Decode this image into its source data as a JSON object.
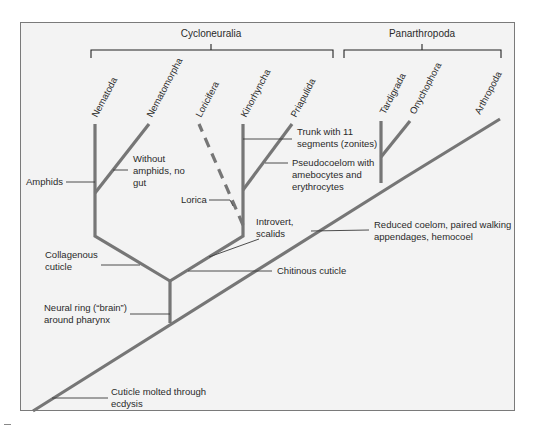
{
  "diagram": {
    "type": "phylogenetic-tree",
    "clades": {
      "cycloneuralia": "Cycloneuralia",
      "panarthropoda": "Panarthropoda"
    },
    "taxa": {
      "nematoda": "Nematoda",
      "nematomorpha": "Nematomorpha",
      "loricifera": "Loricifera",
      "kinorhyncha": "Kinorhyncha",
      "priapulida": "Priapulida",
      "tardigrada": "Tardigrada",
      "onychophora": "Onychophora",
      "arthropoda": "Arthropoda"
    },
    "characters": {
      "amphids": "Amphids",
      "without_amphids_1": "Without",
      "without_amphids_2": "amphids, no",
      "without_amphids_3": "gut",
      "trunk_1": "Trunk with 11",
      "trunk_2": "segments (zonites)",
      "pseudocoelom_1": "Pseudocoelom with",
      "pseudocoelom_2": "amebocytes and",
      "pseudocoelom_3": "erythrocytes",
      "lorica": "Lorica",
      "introvert_1": "Introvert,",
      "introvert_2": "scalids",
      "reduced_coelom_1": "Reduced coelom, paired walking",
      "reduced_coelom_2": "appendages, hemocoel",
      "collagenous_1": "Collagenous",
      "collagenous_2": "cuticle",
      "chitinous": "Chitinous cuticle",
      "neural_ring_1": "Neural ring (“brain”)",
      "neural_ring_2": "around pharynx",
      "cuticle_molted_1": "Cuticle molted through",
      "cuticle_molted_2": "ecdysis"
    },
    "colors": {
      "background": "#f3f3f3",
      "branch": "#767676",
      "text": "#2a2a2a",
      "frame": "#7a7a7a"
    }
  }
}
